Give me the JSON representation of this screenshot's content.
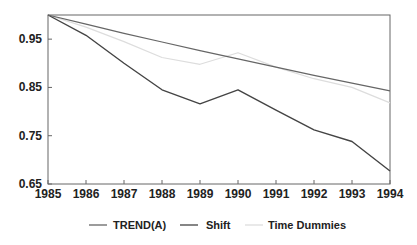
{
  "chart_data": {
    "type": "line",
    "title": "",
    "xlabel": "",
    "ylabel": "",
    "x": [
      1985,
      1986,
      1987,
      1988,
      1989,
      1990,
      1991,
      1992,
      1993,
      1994
    ],
    "xlim": [
      1985,
      1994
    ],
    "ylim": [
      0.65,
      1.0
    ],
    "yticks": [
      "0.65",
      "0.75",
      "0.85",
      "0.95"
    ],
    "ytick_values": [
      0.65,
      0.75,
      0.85,
      0.95
    ],
    "xticks": [
      "1985",
      "1986",
      "1987",
      "1988",
      "1989",
      "1990",
      "1991",
      "1992",
      "1993",
      "1994"
    ],
    "grid": false,
    "legend_position": "bottom",
    "series": [
      {
        "name": "TREND(A)",
        "color": "#666666",
        "width": 1.2,
        "values": [
          1.0,
          0.981,
          0.962,
          0.944,
          0.926,
          0.909,
          0.892,
          0.875,
          0.859,
          0.843
        ]
      },
      {
        "name": "Shift",
        "color": "#444444",
        "width": 1.4,
        "values": [
          1.0,
          0.958,
          0.9,
          0.845,
          0.816,
          0.845,
          0.803,
          0.762,
          0.738,
          0.677
        ]
      },
      {
        "name": "Time Dummies",
        "color": "#dddddd",
        "width": 1.2,
        "values": [
          1.0,
          0.975,
          0.945,
          0.912,
          0.898,
          0.922,
          0.892,
          0.868,
          0.85,
          0.818
        ]
      }
    ]
  }
}
